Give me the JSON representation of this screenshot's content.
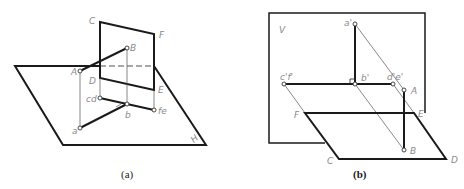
{
  "figures": [
    {
      "id": "a",
      "caption": "(a)",
      "description": "Pictorial view: line AB intersecting vertical plane CDEF standing on H plane",
      "plane_label": "H",
      "labels": {
        "C": "C",
        "F": "F",
        "B": "B",
        "A": "A",
        "D": "D",
        "E": "E",
        "cd": "cd",
        "b": "b",
        "fe": "fe",
        "a": "a",
        "H": "H"
      }
    },
    {
      "id": "b",
      "caption": "(b)",
      "description": "Pictorial view with V plane projections: a', b', c'f', d'e' and horizontal plane CDEF",
      "plane_label": "V",
      "labels": {
        "V": "V",
        "a_prime": "a'",
        "cf_prime": "c'f'",
        "b_prime": "b'",
        "de_prime": "d'e'",
        "A": "A",
        "B": "B",
        "F": "F",
        "E": "E",
        "C": "C",
        "D": "D"
      }
    }
  ],
  "colors": {
    "line": "#1a1a1a",
    "thin_line": "#555555",
    "label": "#8a8a8a",
    "background": "#ffffff"
  }
}
